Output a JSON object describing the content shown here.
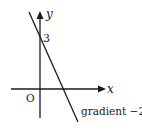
{
  "diagram": {
    "axes": {
      "x_label": "x",
      "y_label": "y",
      "origin_label": "O"
    },
    "line": {
      "y_intercept_label": "3",
      "annotation": "gradient −2",
      "gradient": -2,
      "y_intercept": 3
    },
    "colors": {
      "ink": "#1a1a1a",
      "background": "#ffffff"
    }
  }
}
